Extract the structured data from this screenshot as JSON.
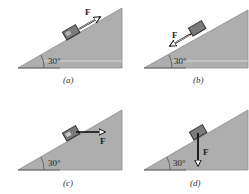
{
  "figure": {
    "colors": {
      "incline_fill": "#aeaeae",
      "incline_stroke": "#8a8a8a",
      "baseline_highlight": "#d9d9d9",
      "block_fill": "#7a7a7a",
      "arrow": "#111111",
      "text": "#222222"
    },
    "panels": [
      {
        "id": "a",
        "caption": "(a)",
        "angle_label": "30°",
        "force_label": "F",
        "force_direction": "up the incline"
      },
      {
        "id": "b",
        "caption": "(b)",
        "angle_label": "30°",
        "force_label": "F",
        "force_direction": "down the incline"
      },
      {
        "id": "c",
        "caption": "(c)",
        "angle_label": "30°",
        "force_label": "F",
        "force_direction": "horizontal to the right"
      },
      {
        "id": "d",
        "caption": "(d)",
        "angle_label": "30°",
        "force_label": "F",
        "force_direction": "vertically downward"
      }
    ]
  }
}
